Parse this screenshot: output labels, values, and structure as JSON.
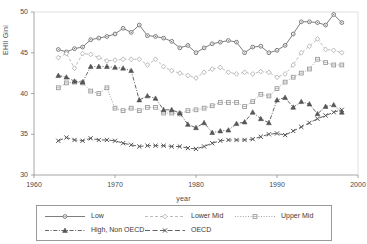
{
  "chart_data": {
    "type": "line",
    "title": "",
    "xlabel": "year",
    "ylabel": "EHII Gini",
    "xlim": [
      1960,
      2000
    ],
    "ylim": [
      30,
      50
    ],
    "xticks": [
      1960,
      1970,
      1980,
      1990,
      2000
    ],
    "yticks": [
      30,
      35,
      40,
      45,
      50
    ],
    "grid": false,
    "legend_position": "below-axis",
    "x": [
      1963,
      1964,
      1965,
      1966,
      1967,
      1968,
      1969,
      1970,
      1971,
      1972,
      1973,
      1974,
      1975,
      1976,
      1977,
      1978,
      1979,
      1980,
      1981,
      1982,
      1983,
      1984,
      1985,
      1986,
      1987,
      1988,
      1989,
      1990,
      1991,
      1992,
      1993,
      1994,
      1995,
      1996,
      1997,
      1998
    ],
    "series": [
      {
        "name": "Low",
        "marker": "circle",
        "dash": "solid",
        "color": "#6e6e6e",
        "values": [
          45.4,
          45.1,
          45.5,
          45.7,
          46.6,
          46.8,
          47.0,
          47.3,
          48.0,
          47.5,
          48.4,
          47.1,
          47.0,
          46.8,
          46.4,
          45.6,
          45.9,
          45.0,
          45.6,
          46.1,
          46.3,
          46.5,
          46.3,
          45.0,
          45.7,
          45.8,
          45.0,
          45.3,
          45.9,
          47.3,
          48.8,
          48.8,
          48.7,
          48.4,
          49.7,
          48.7
        ]
      },
      {
        "name": "Lower Mid",
        "marker": "diamond",
        "dash": "dashed",
        "color": "#b4b4b4",
        "values": [
          44.4,
          44.9,
          43.1,
          44.9,
          44.8,
          44.4,
          44.0,
          44.1,
          44.2,
          44.2,
          44.2,
          43.5,
          44.2,
          43.3,
          42.8,
          42.5,
          42.2,
          41.9,
          42.6,
          43.0,
          43.2,
          42.6,
          42.4,
          42.6,
          42.4,
          42.7,
          42.6,
          42.0,
          42.4,
          43.5,
          45.0,
          45.8,
          46.7,
          45.4,
          45.3,
          45.0
        ]
      },
      {
        "name": "Upper Mid",
        "marker": "square",
        "dash": "dotted",
        "color": "#9a9a9a",
        "values": [
          40.7,
          41.3,
          41.4,
          41.3,
          40.3,
          40.0,
          40.7,
          38.2,
          37.9,
          38.2,
          37.9,
          38.3,
          38.3,
          37.6,
          37.6,
          37.5,
          37.9,
          38.0,
          38.2,
          38.5,
          38.9,
          38.9,
          38.9,
          38.4,
          39.0,
          39.9,
          39.7,
          40.6,
          41.4,
          42.0,
          42.5,
          43.0,
          44.2,
          43.8,
          43.5,
          43.5
        ]
      },
      {
        "name": "High, Non OECD",
        "marker": "triangle",
        "dash": "dashdot",
        "color": "#555555",
        "values": [
          42.2,
          42.0,
          41.5,
          41.4,
          43.3,
          43.3,
          43.3,
          43.2,
          43.1,
          42.8,
          39.2,
          39.7,
          39.4,
          38.0,
          38.0,
          37.6,
          36.2,
          35.8,
          36.4,
          35.2,
          35.4,
          35.5,
          36.3,
          36.5,
          37.7,
          36.9,
          36.4,
          39.2,
          39.5,
          38.3,
          39.0,
          38.7,
          37.5,
          38.4,
          38.6,
          37.7
        ]
      },
      {
        "name": "OECD",
        "marker": "cross",
        "dash": "longdash",
        "color": "#505050",
        "values": [
          34.2,
          34.6,
          34.3,
          34.2,
          34.5,
          34.3,
          34.3,
          34.2,
          33.9,
          33.7,
          33.5,
          33.6,
          33.6,
          33.6,
          33.5,
          33.5,
          33.3,
          33.2,
          33.5,
          33.9,
          34.2,
          34.3,
          34.3,
          34.3,
          34.4,
          34.7,
          35.0,
          35.1,
          34.9,
          35.4,
          35.9,
          36.4,
          36.9,
          37.3,
          37.7,
          38.0
        ]
      }
    ]
  },
  "legend": {
    "items": [
      {
        "label": "Low"
      },
      {
        "label": "Lower Mid"
      },
      {
        "label": "Upper Mid"
      },
      {
        "label": "High, Non OECD"
      },
      {
        "label": "OECD"
      }
    ]
  }
}
